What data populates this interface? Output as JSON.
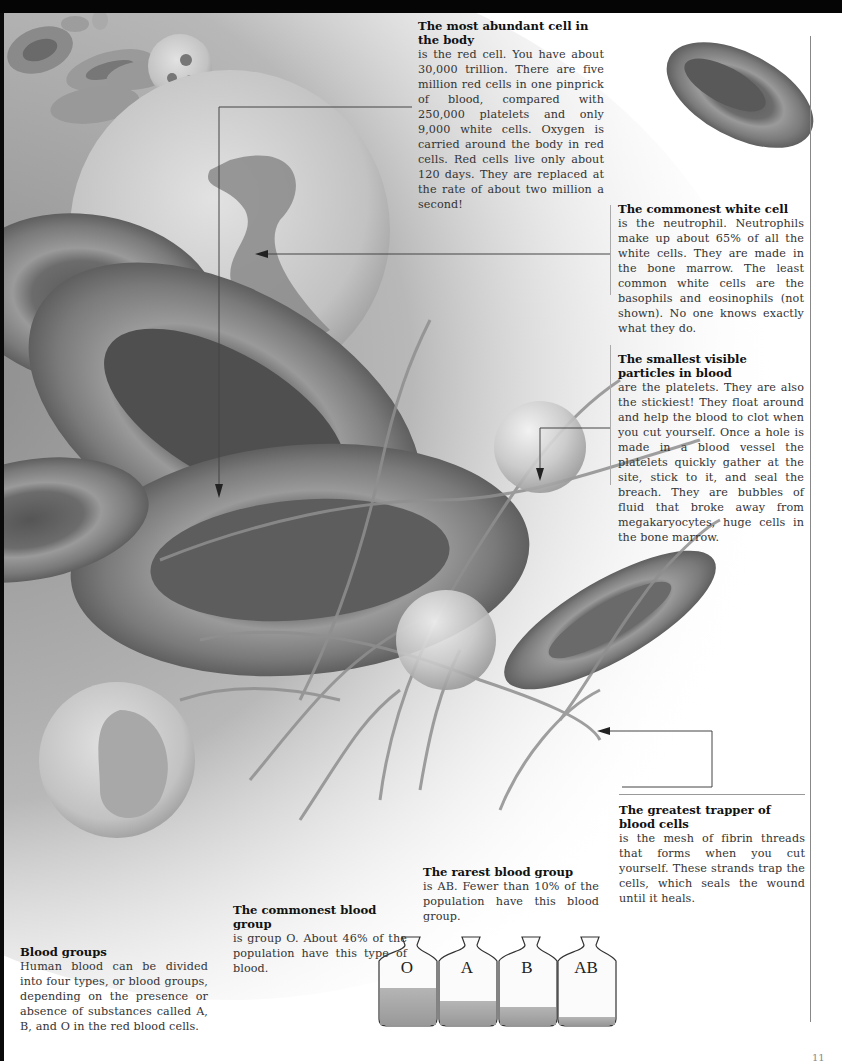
{
  "page": {
    "page_number": "11"
  },
  "annotations": {
    "abundant_cell": {
      "heading": "The most abundant cell in the body",
      "body": "is the red cell. You have about 30,000 trillion. There are five million red cells in one pinprick of blood, compared with 250,000 platelets and only 9,000 white cells. Oxygen is carried around the body in red cells. Red cells live only about 120 days. They are replaced at the rate of about two million a second!"
    },
    "white_cell": {
      "heading": "The commonest white cell",
      "body": "is the neutrophil. Neutrophils make up about 65% of all the white cells. They are made in the bone marrow. The least common white cells are the basophils and eosinophils (not shown). No one knows exactly what they do."
    },
    "smallest_particles": {
      "heading": "The smallest visible particles in blood",
      "body": "are the platelets. They are also the stickiest! They float around and help the blood to clot when you cut yourself. Once a hole is made in a blood vessel the platelets quickly gather at the site, stick to it, and seal the breach. They are bubbles of fluid that broke away from megakaryocytes, huge cells in the bone marrow."
    },
    "greatest_trapper": {
      "heading": "The greatest trapper of blood cells",
      "body": "is the mesh of fibrin threads that forms when you cut yourself. These strands trap the cells, which seals the wound until it heals."
    },
    "rarest_group": {
      "heading": "The rarest blood group",
      "body": "is AB. Fewer than 10% of the population have this blood group."
    },
    "commonest_group": {
      "heading": "The commonest blood group",
      "body": "is group O. About 46% of the population have this type of blood."
    },
    "blood_groups": {
      "heading": "Blood groups",
      "body": "Human blood can be divided into four types, or blood groups, depending on the presence or absence of substances called A, B, and O in the red blood cells."
    }
  },
  "bottles": [
    {
      "label": "O",
      "fill_level": 0.55
    },
    {
      "label": "A",
      "fill_level": 0.38
    },
    {
      "label": "B",
      "fill_level": 0.24
    },
    {
      "label": "AB",
      "fill_level": 0.1
    }
  ],
  "colors": {
    "background": "#ffffff",
    "top_bar": "#050505",
    "rule": "#888888",
    "bottle_liquid": "#a8a8a8"
  }
}
